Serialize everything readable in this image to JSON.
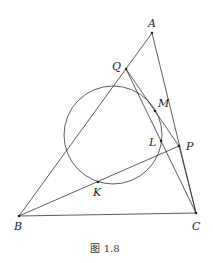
{
  "caption": "图 1.8",
  "points": {
    "A": {
      "label": "A",
      "x": 152,
      "y": 33
    },
    "Q": {
      "label": "Q",
      "x": 126,
      "y": 69
    },
    "M": {
      "label": "M",
      "x": 155,
      "y": 111
    },
    "L": {
      "label": "L",
      "x": 161,
      "y": 141
    },
    "P": {
      "label": "P",
      "x": 179,
      "y": 146
    },
    "K": {
      "label": "K",
      "x": 98,
      "y": 182
    },
    "B": {
      "label": "B",
      "x": 19,
      "y": 216
    },
    "C": {
      "label": "C",
      "x": 196,
      "y": 213
    }
  },
  "circle": {
    "cx": 113,
    "cy": 135,
    "r": 49
  },
  "segments": [
    [
      "A",
      "B"
    ],
    [
      "A",
      "C"
    ],
    [
      "B",
      "C"
    ],
    [
      "B",
      "P"
    ],
    [
      "Q",
      "P"
    ],
    [
      "Q",
      "C"
    ]
  ],
  "colors": {
    "stroke": "#333333",
    "background": "#ffffff"
  }
}
